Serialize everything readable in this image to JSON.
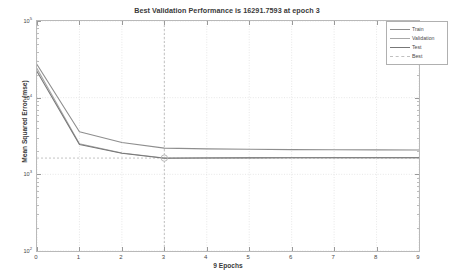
{
  "chart_data": {
    "type": "line",
    "title": "Best Validation Performance is 16291.7593 at epoch 3",
    "xlabel": "9 Epochs",
    "ylabel": "Mean Squared Error (mse)",
    "yscale": "log",
    "xlim": [
      0,
      9
    ],
    "ylim": [
      100,
      100000
    ],
    "grid": true,
    "legend_position": "top-right",
    "x": [
      0,
      1,
      2,
      3,
      4,
      5,
      6,
      7,
      8,
      9
    ],
    "xticks": [
      "0",
      "1",
      "2",
      "3",
      "4",
      "5",
      "6",
      "7",
      "8",
      "9"
    ],
    "yticks": [
      "10^2",
      "10^3",
      "10^4",
      "10^5"
    ],
    "ytick_values": [
      100,
      1000,
      10000,
      100000
    ],
    "series": [
      {
        "name": "Train",
        "color": "#8e8e8e",
        "style": "solid",
        "values": [
          27000,
          3600,
          2600,
          2200,
          2150,
          2120,
          2100,
          2090,
          2085,
          2080
        ]
      },
      {
        "name": "Validation",
        "color": "#a8a8a8",
        "style": "solid",
        "values": [
          24000,
          2500,
          1900,
          1630,
          1640,
          1645,
          1648,
          1650,
          1651,
          1652
        ]
      },
      {
        "name": "Test",
        "color": "#777777",
        "style": "solid",
        "values": [
          22000,
          2450,
          1880,
          1620,
          1635,
          1640,
          1644,
          1646,
          1647,
          1648
        ]
      },
      {
        "name": "Best",
        "color": "#b4b4b4",
        "style": "dashed",
        "best_epoch": 3,
        "best_value": 16291.7593
      }
    ],
    "best_marker": {
      "epoch": 3,
      "label": "best-validation-marker"
    }
  },
  "legend": {
    "items": [
      {
        "label": "Train",
        "color": "#8e8e8e",
        "style": "solid"
      },
      {
        "label": "Validation",
        "color": "#a8a8a8",
        "style": "solid"
      },
      {
        "label": "Test",
        "color": "#777777",
        "style": "solid"
      },
      {
        "label": "Best",
        "color": "#c0c0c0",
        "style": "dashed"
      }
    ]
  },
  "axes": {
    "x_ticks": [
      "0",
      "1",
      "2",
      "3",
      "4",
      "5",
      "6",
      "7",
      "8",
      "9"
    ],
    "y_ticks": [
      {
        "mantissa": "10",
        "exponent": "5"
      },
      {
        "mantissa": "10",
        "exponent": "4"
      },
      {
        "mantissa": "10",
        "exponent": "3"
      },
      {
        "mantissa": "10",
        "exponent": "2"
      }
    ]
  }
}
